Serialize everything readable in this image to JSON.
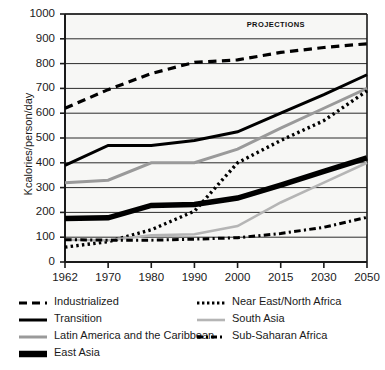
{
  "chart_data": {
    "type": "line",
    "title": "",
    "xlabel": "",
    "ylabel": "Kcalories/person/day",
    "annotation": "PROJECTIONS",
    "annotation_start_year": 1990,
    "grid": true,
    "legend_position": "bottom",
    "categories": [
      "1962",
      "1970",
      "1980",
      "1990",
      "2000",
      "2015",
      "2030",
      "2050"
    ],
    "x": [
      1962,
      1970,
      1980,
      1990,
      2000,
      2015,
      2030,
      2050
    ],
    "xlim": [
      1962,
      2050
    ],
    "ylim": [
      0,
      1000
    ],
    "yticks": [
      "0",
      "100",
      "200",
      "300",
      "400",
      "500",
      "600",
      "700",
      "800",
      "900",
      "1000"
    ],
    "series": [
      {
        "name": "Industrialized",
        "style": "dashed",
        "color": "#000000",
        "width": 3.2,
        "values": [
          620,
          695,
          760,
          805,
          815,
          845,
          865,
          880
        ]
      },
      {
        "name": "Transition",
        "style": "solid",
        "color": "#000000",
        "width": 3.0,
        "values": [
          390,
          470,
          470,
          490,
          525,
          600,
          675,
          755
        ]
      },
      {
        "name": "Latin America and the Caribbean",
        "style": "solid",
        "color": "#9a9a9a",
        "width": 3.0,
        "values": [
          320,
          330,
          400,
          400,
          455,
          540,
          620,
          700
        ]
      },
      {
        "name": "East Asia",
        "style": "solid-thick",
        "color": "#000000",
        "width": 5.5,
        "values": [
          175,
          178,
          228,
          232,
          258,
          310,
          365,
          420
        ]
      },
      {
        "name": "Near East/North Africa",
        "style": "dotted",
        "color": "#000000",
        "width": 3.4,
        "values": [
          60,
          82,
          130,
          205,
          400,
          490,
          570,
          690
        ]
      },
      {
        "name": "South Asia",
        "style": "solid",
        "color": "#b5b5b5",
        "width": 2.6,
        "values": [
          90,
          88,
          108,
          112,
          145,
          240,
          320,
          400
        ]
      },
      {
        "name": "Sub-Saharan Africa",
        "style": "dashdot",
        "color": "#000000",
        "width": 3.0,
        "values": [
          90,
          88,
          88,
          92,
          98,
          115,
          140,
          180
        ]
      }
    ]
  },
  "legend": {
    "left": [
      {
        "label": "Industrialized",
        "swatch": "dashed-black"
      },
      {
        "label": "Transition",
        "swatch": "solid-black"
      },
      {
        "label": "Latin America and the Caribbean",
        "swatch": "solid-gray"
      },
      {
        "label": "East Asia",
        "swatch": "thick-black"
      }
    ],
    "right": [
      {
        "label": "Near East/North Africa",
        "swatch": "dotted-black"
      },
      {
        "label": "South Asia",
        "swatch": "solid-lightgray"
      },
      {
        "label": "Sub-Saharan Africa",
        "swatch": "dashdot-black"
      }
    ]
  }
}
